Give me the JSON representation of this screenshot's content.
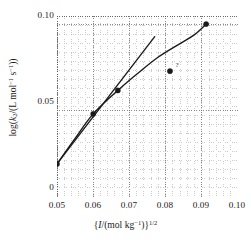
{
  "chart_data": {
    "type": "scatter",
    "title": "",
    "xlabel": "{I/(mol kg⁻¹)}¹ᐟ²",
    "ylabel": "log(k₂/(L mol⁻¹ s⁻¹))",
    "xlim": [
      0.05,
      0.1
    ],
    "ylim": [
      0.0,
      0.105
    ],
    "xticks": [
      0.05,
      0.06,
      0.07,
      0.08,
      0.09,
      0.1
    ],
    "xticklabels": [
      "0.05",
      "0.06",
      "0.07",
      "0.08",
      "0.09",
      "0.10"
    ],
    "yticks": [
      0.0,
      0.05,
      0.1
    ],
    "yticklabels": [
      "0",
      "0.05",
      "0.10"
    ],
    "grid": true,
    "grid_style": "dotted",
    "legend": "none",
    "series": [
      {
        "name": "measured points",
        "type": "scatter",
        "marker": "filled-circle",
        "color": "#1a1a1a",
        "points": [
          {
            "x": 0.05,
            "y": 0.0192
          },
          {
            "x": 0.06,
            "y": 0.0482
          },
          {
            "x": 0.0668,
            "y": 0.0618
          },
          {
            "x": 0.0812,
            "y": 0.073,
            "label": "?",
            "outlier": true
          },
          {
            "x": 0.0912,
            "y": 0.1003
          }
        ]
      },
      {
        "name": "curved fit",
        "type": "line",
        "color": "#1a1a1a",
        "points": [
          {
            "x": 0.05,
            "y": 0.0192
          },
          {
            "x": 0.055,
            "y": 0.034
          },
          {
            "x": 0.06,
            "y": 0.0482
          },
          {
            "x": 0.0668,
            "y": 0.0618
          },
          {
            "x": 0.072,
            "y": 0.0712
          },
          {
            "x": 0.078,
            "y": 0.0812
          },
          {
            "x": 0.084,
            "y": 0.089
          },
          {
            "x": 0.088,
            "y": 0.0942
          },
          {
            "x": 0.0912,
            "y": 0.1003
          }
        ]
      },
      {
        "name": "limiting-slope line",
        "type": "line",
        "color": "#1a1a1a",
        "points": [
          {
            "x": 0.05,
            "y": 0.0192
          },
          {
            "x": 0.077,
            "y": 0.093
          }
        ]
      }
    ],
    "annotations": [
      {
        "text": "?",
        "x": 0.0824,
        "y": 0.0762
      }
    ]
  },
  "axes": {
    "y": {
      "label_html": "log(<i>k</i><sub>2</sub>/(L mol<sup>−1</sup> s<sup>−1</sup>))",
      "ticks": [
        {
          "value": 0.1,
          "label": "0.10"
        },
        {
          "value": 0.05,
          "label": "0.05"
        },
        {
          "value": 0.0,
          "label": "0"
        }
      ]
    },
    "x": {
      "label_html": "{<i>I</i>/(mol kg<sup>−1</sup>)}<sup>1/2</sup>",
      "ticks": [
        {
          "value": 0.05,
          "label": "0.05"
        },
        {
          "value": 0.06,
          "label": "0.06"
        },
        {
          "value": 0.07,
          "label": "0.07"
        },
        {
          "value": 0.08,
          "label": "0.08"
        },
        {
          "value": 0.09,
          "label": "0.09"
        },
        {
          "value": 0.1,
          "label": "0.10"
        }
      ]
    }
  },
  "tick_labels": {
    "y0": "0",
    "y1": "0.05",
    "y2": "0.10",
    "x0": "0.05",
    "x1": "0.06",
    "x2": "0.07",
    "x3": "0.08",
    "x4": "0.09",
    "x5": "0.10"
  },
  "annotation": {
    "outlier_query": "?"
  },
  "colors": {
    "ink": "#1a1a1a",
    "grid": "#9a9a9a",
    "background": "#ffffff"
  }
}
